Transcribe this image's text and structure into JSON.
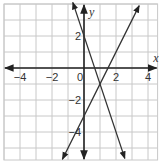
{
  "chart_data": {
    "type": "line",
    "title": "",
    "xlabel": "x",
    "ylabel": "y",
    "xlim": [
      -5,
      4.6
    ],
    "ylim": [
      -5.75,
      4
    ],
    "grid": true,
    "grid_step": 1,
    "x_ticks": [
      -4,
      -2,
      0,
      2,
      4
    ],
    "y_ticks": [
      2,
      -2,
      -4
    ],
    "x_tick_labels": [
      "−4",
      "−2",
      "0",
      "2",
      "4"
    ],
    "y_tick_labels": [
      "2",
      "−2",
      "−4"
    ],
    "series": [
      {
        "name": "line-1",
        "equation": "y = -3x + 2",
        "slope": -3,
        "intercept": 2,
        "x": [
          -0.7,
          2.55
        ],
        "y": [
          4.1,
          -5.65
        ],
        "arrows": "both"
      },
      {
        "name": "line-2",
        "equation": "y = 2x - 3",
        "slope": 2,
        "intercept": -3,
        "x": [
          -1.35,
          3.45
        ],
        "y": [
          -5.7,
          3.9
        ],
        "arrows": "both"
      }
    ],
    "annotations": [
      {
        "type": "intersection",
        "x": 1,
        "y": -1
      }
    ],
    "colors": {
      "grid": "#c8c8c8",
      "axis": "#222222",
      "line": "#333333"
    }
  }
}
